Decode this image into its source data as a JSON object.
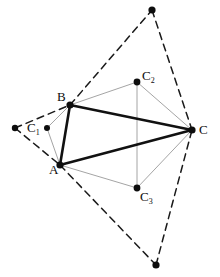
{
  "figure": {
    "background_color": "#ffffff",
    "width": 220,
    "height": 277,
    "colors": {
      "solid_stroke": "#111111",
      "dashed_stroke": "#1a1a1a",
      "thin_stroke": "#9a9a9a",
      "vertex_fill": "#0d0d0d",
      "label_color": "#0d0d0d"
    },
    "labels": {
      "A": "A",
      "B": "B",
      "C": "C",
      "C1_base": "C",
      "C1_sub": "1",
      "C2_base": "C",
      "C2_sub": "2",
      "C3_base": "C",
      "C3_sub": "3"
    }
  },
  "chart_data": {
    "type": "scatter",
    "xlabel": "",
    "ylabel": "",
    "xlim": [
      0,
      220
    ],
    "ylim": [
      0,
      277
    ],
    "grid": false,
    "legend": "none",
    "points": [
      {
        "name": "A",
        "label": "A",
        "x": 60,
        "y": 165,
        "marker": "filled-circle",
        "radius": 3.6,
        "label_dx": -11,
        "label_dy": 9
      },
      {
        "name": "B",
        "label": "B",
        "x": 70,
        "y": 105,
        "marker": "filled-circle",
        "radius": 3.6,
        "label_dx": -13,
        "label_dy": -4
      },
      {
        "name": "C",
        "label": "C",
        "x": 192,
        "y": 130,
        "marker": "filled-circle",
        "radius": 3.6,
        "label_dx": 7,
        "label_dy": 4
      },
      {
        "name": "C1",
        "label": "C1",
        "x": 47,
        "y": 128,
        "marker": "filled-circle",
        "radius": 3.0,
        "label_dx": -20,
        "label_dy": 4
      },
      {
        "name": "C2",
        "label": "C2",
        "x": 137,
        "y": 82,
        "marker": "filled-circle",
        "radius": 3.4,
        "label_dx": 5,
        "label_dy": -2
      },
      {
        "name": "C3",
        "label": "C3",
        "x": 137,
        "y": 188,
        "marker": "filled-circle",
        "radius": 3.4,
        "label_dx": 3,
        "label_dy": 13
      },
      {
        "name": "P_left",
        "label": "",
        "x": 15,
        "y": 128,
        "marker": "filled-circle",
        "radius": 3.2
      },
      {
        "name": "P_top",
        "label": "",
        "x": 152,
        "y": 10,
        "marker": "filled-circle",
        "radius": 3.6
      },
      {
        "name": "P_bottom",
        "label": "",
        "x": 156,
        "y": 265,
        "marker": "filled-circle",
        "radius": 3.6
      }
    ],
    "segments": [
      {
        "name": "side-AB",
        "from": "A",
        "to": "B",
        "style": "solid",
        "width": 2.6
      },
      {
        "name": "side-BC",
        "from": "B",
        "to": "C",
        "style": "solid",
        "width": 2.6
      },
      {
        "name": "side-CA",
        "from": "C",
        "to": "A",
        "style": "solid",
        "width": 2.6
      },
      {
        "name": "thin-C1-B",
        "from": "C1",
        "to": "B",
        "style": "thin",
        "width": 0.9
      },
      {
        "name": "thin-C1-A",
        "from": "C1",
        "to": "A",
        "style": "thin",
        "width": 0.9
      },
      {
        "name": "thin-B-C2",
        "from": "B",
        "to": "C2",
        "style": "thin",
        "width": 0.9
      },
      {
        "name": "thin-C2-C",
        "from": "C2",
        "to": "C",
        "style": "thin",
        "width": 0.9
      },
      {
        "name": "thin-A-C3",
        "from": "A",
        "to": "C3",
        "style": "thin",
        "width": 0.9
      },
      {
        "name": "thin-C3-C",
        "from": "C3",
        "to": "C",
        "style": "thin",
        "width": 0.9
      },
      {
        "name": "thin-C2-C3",
        "from": "C2",
        "to": "C3",
        "style": "thin",
        "width": 0.9
      },
      {
        "name": "dashed-Pleft-B",
        "from": "P_left",
        "to": "B",
        "style": "dashed",
        "width": 1.5
      },
      {
        "name": "dashed-Pleft-A",
        "from": "P_left",
        "to": "A",
        "style": "dashed",
        "width": 1.5
      },
      {
        "name": "dashed-B-Ptop",
        "from": "B",
        "to": "P_top",
        "style": "dashed",
        "width": 1.5
      },
      {
        "name": "dashed-Ptop-C",
        "from": "P_top",
        "to": "C",
        "style": "dashed",
        "width": 1.5
      },
      {
        "name": "dashed-A-Pbottom",
        "from": "A",
        "to": "P_bottom",
        "style": "dashed",
        "width": 1.5
      },
      {
        "name": "dashed-Pbottom-C",
        "from": "P_bottom",
        "to": "C",
        "style": "dashed",
        "width": 1.5
      }
    ]
  }
}
